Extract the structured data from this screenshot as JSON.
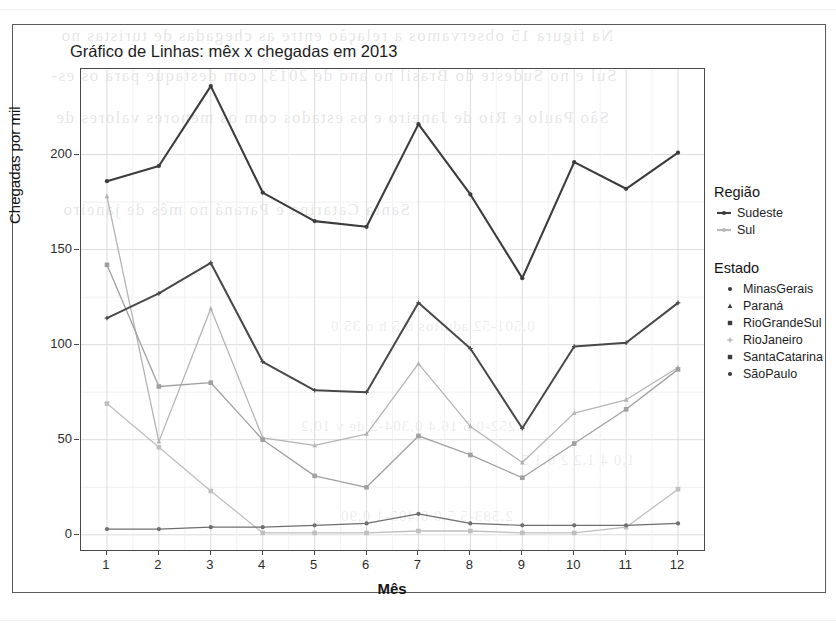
{
  "page": {
    "ghost_text_lines": [
      "Na figura 15 observamos a relação entre as chegadas de turistas no",
      "Sul e no Sudeste do Brasil no ano de 2013, com destaque para os es-",
      "São Paulo e Rio de Janeiro e os estados com os menores valores de",
      "Santa Catarina e Paraná no mês de janeiro"
    ],
    "ghost_text_columns": [
      "0,501-52 adultos 8,5 h o 35 0",
      "0,252-0,5 16,4 0,304-2 de v 10,2",
      "2,583-5 5,0 0,405-1 0,90",
      "1,0 4 1,2 2 0,1 5"
    ]
  },
  "chart_data": {
    "type": "line",
    "title": "Gráfico de Linhas: mêx x chegadas em 2013",
    "xlabel": "Mês",
    "ylabel": "Chegadas por mil",
    "x": [
      1,
      2,
      3,
      4,
      5,
      6,
      7,
      8,
      9,
      10,
      11,
      12
    ],
    "xtick_labels": [
      "1",
      "2",
      "3",
      "4",
      "5",
      "6",
      "7",
      "8",
      "9",
      "10",
      "11",
      "12"
    ],
    "ytick_labels": [
      "0",
      "50",
      "100",
      "150",
      "200"
    ],
    "yticks": [
      0,
      50,
      100,
      150,
      200
    ],
    "xlim": [
      0.5,
      12.5
    ],
    "ylim": [
      -8,
      245
    ],
    "grid": true,
    "legend_position": "right",
    "series": [
      {
        "name": "SãoPaulo",
        "regiao": "Sudeste",
        "color": "#3c3c3c",
        "width": 2.1,
        "shape": "circle",
        "values": [
          186,
          194,
          236,
          180,
          165,
          162,
          216,
          179,
          135,
          196,
          182,
          201
        ]
      },
      {
        "name": "RioJaneiro",
        "regiao": "Sudeste",
        "color": "#484848",
        "width": 2.0,
        "shape": "plus",
        "values": [
          114,
          127,
          143,
          91,
          76,
          75,
          122,
          98,
          56,
          99,
          101,
          122
        ]
      },
      {
        "name": "MinasGerais",
        "regiao": "Sudeste",
        "color": "#6f6f6f",
        "width": 1.2,
        "shape": "circle",
        "values": [
          3,
          3,
          4,
          4,
          5,
          6,
          11,
          6,
          5,
          5,
          5,
          6
        ]
      },
      {
        "name": "Paraná",
        "regiao": "Sul",
        "color": "#b4b4b4",
        "width": 1.3,
        "shape": "triangle",
        "values": [
          178,
          49,
          119,
          51,
          47,
          53,
          90,
          57,
          38,
          64,
          71,
          88
        ]
      },
      {
        "name": "SantaCatarina",
        "regiao": "Sul",
        "color": "#a0a0a0",
        "width": 1.3,
        "shape": "square",
        "values": [
          142,
          78,
          80,
          50,
          31,
          25,
          52,
          42,
          30,
          48,
          66,
          87
        ]
      },
      {
        "name": "RioGrandeSul",
        "regiao": "Sul",
        "color": "#bfbfbf",
        "width": 1.3,
        "shape": "square",
        "values": [
          69,
          46,
          23,
          1,
          1,
          1,
          2,
          2,
          1,
          1,
          4,
          24
        ]
      }
    ]
  },
  "legend": {
    "regiao": {
      "title": "Região",
      "items": [
        {
          "label": "Sudeste",
          "color": "#3c3c3c",
          "key": "line"
        },
        {
          "label": "Sul",
          "color": "#b8b8b8",
          "key": "line"
        }
      ]
    },
    "estado": {
      "title": "Estado",
      "items": [
        {
          "label": "MinasGerais",
          "shape": "circle",
          "color": "#3c3c3c"
        },
        {
          "label": "Paraná",
          "shape": "triangle",
          "color": "#3c3c3c"
        },
        {
          "label": "RioGrandeSul",
          "shape": "square-filled",
          "color": "#3c3c3c"
        },
        {
          "label": "RioJaneiro",
          "shape": "plus",
          "color": "#b0b0b0"
        },
        {
          "label": "SantaCatarina",
          "shape": "square",
          "color": "#3c3c3c"
        },
        {
          "label": "SãoPaulo",
          "shape": "circle-cross",
          "color": "#3c3c3c"
        }
      ]
    }
  }
}
